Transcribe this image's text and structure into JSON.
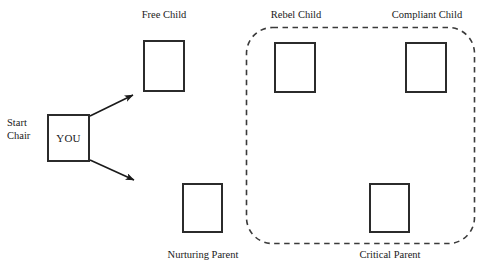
{
  "diagram": {
    "colors": {
      "background": "#ffffff",
      "box_stroke": "#2b2b2b",
      "arrow_stroke": "#1a1a1a",
      "dashed_stroke": "#3a3a3a",
      "text": "#1a1a1a"
    },
    "start_chair": {
      "label_line1": "Start",
      "label_line2": "Chair",
      "box_text": "YOU"
    },
    "nodes": [
      {
        "id": "free-child",
        "label": "Free Child",
        "label_position": "above"
      },
      {
        "id": "rebel-child",
        "label": "Rebel Child",
        "label_position": "above"
      },
      {
        "id": "compliant-child",
        "label": "Compliant Child",
        "label_position": "above"
      },
      {
        "id": "nurturing-parent",
        "label": "Nurturing Parent",
        "label_position": "below"
      },
      {
        "id": "critical-parent",
        "label": "Critical Parent",
        "label_position": "below"
      }
    ],
    "arrows": [
      {
        "id": "arrow-to-free-child",
        "from": "start-chair",
        "to": "free-child"
      },
      {
        "id": "arrow-to-nurturing-parent",
        "from": "start-chair",
        "to": "nurturing-parent"
      }
    ],
    "group": {
      "id": "dashed-group",
      "style": "dashed-rounded-rectangle",
      "members": [
        "rebel-child",
        "compliant-child",
        "critical-parent"
      ]
    }
  }
}
